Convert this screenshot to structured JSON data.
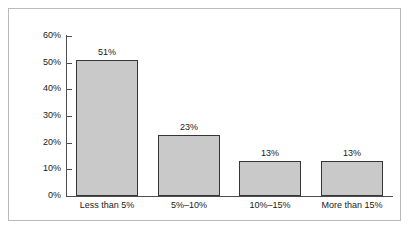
{
  "chart_data": {
    "type": "bar",
    "title": "",
    "subtitle": "",
    "xlabel": "",
    "ylabel": "",
    "categories": [
      "Less than 5%",
      "5%–10%",
      "10%–15%",
      "More than 15%"
    ],
    "values": [
      51,
      23,
      13,
      13
    ],
    "value_labels": [
      "51%",
      "23%",
      "13%",
      "13%"
    ],
    "ylim": [
      0,
      60
    ],
    "ytick_values": [
      0,
      10,
      20,
      30,
      40,
      50,
      60
    ],
    "ytick_labels": [
      "0%",
      "10%",
      "20%",
      "30%",
      "40%",
      "50%",
      "60%"
    ],
    "grid": false,
    "legend": null,
    "legend_position": "none",
    "annotations": [],
    "colors": {
      "bar_fill": "#c9c9c9",
      "bar_outline": "#363636",
      "axis": "#4d4d4d",
      "text": "#1a1a1a",
      "background": "#ffffff",
      "frame_border": "#b9b9b9"
    }
  }
}
